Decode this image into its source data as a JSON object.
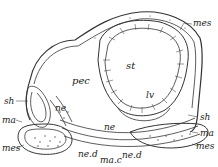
{
  "figure": {
    "labels": {
      "mes_top": "mes",
      "pec": "pec",
      "st": "st",
      "sh_left": "sh",
      "ne_left": "ne",
      "ma_left": "ma",
      "mes_left": "mes",
      "ne_d_left": "ne.d",
      "ma_c": "ma.c",
      "ne_d_right": "ne.d",
      "ne_center": "ne",
      "lv": "lv",
      "sh_right": "sh",
      "ma_right": "ma",
      "mes_right": "mes"
    }
  }
}
